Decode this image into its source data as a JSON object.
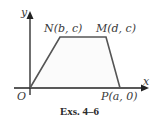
{
  "figure": {
    "caption": "Exs. 4–6",
    "axes": {
      "x_label": "x",
      "y_label": "y",
      "origin_label": "O"
    },
    "points": [
      {
        "id": "N",
        "label": "N(b, c)"
      },
      {
        "id": "M",
        "label": "M(d, c)"
      },
      {
        "id": "P",
        "label": "P(a, 0)"
      }
    ],
    "shape": "trapezoid ONMP",
    "colors": {
      "stroke": "#555555",
      "fill": "#fbfbfb",
      "axis": "#222222"
    }
  }
}
